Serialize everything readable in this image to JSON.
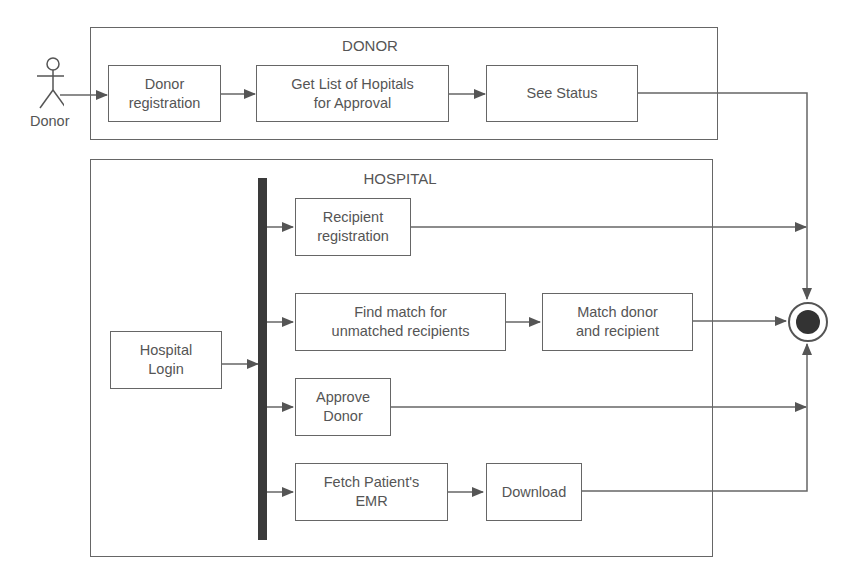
{
  "actor": {
    "label": "Donor"
  },
  "lanes": {
    "donor": {
      "title": "DONOR"
    },
    "hospital": {
      "title": "HOSPITAL"
    }
  },
  "nodes": {
    "donor_registration": "Donor\nregistration",
    "get_hospitals": "Get List of Hopitals\nfor Approval",
    "see_status": "See Status",
    "hospital_login": "Hospital\nLogin",
    "recipient_registration": "Recipient\nregistration",
    "find_match": "Find match for\nunmatched recipients",
    "match_donor_recipient": "Match donor\nand recipient",
    "approve_donor": "Approve\nDonor",
    "fetch_emr": "Fetch Patient's\nEMR",
    "download": "Download"
  },
  "final_node": {
    "type": "activity-final"
  },
  "colors": {
    "line": "#666666",
    "fork": "#3a3a3a",
    "text": "#555555"
  }
}
